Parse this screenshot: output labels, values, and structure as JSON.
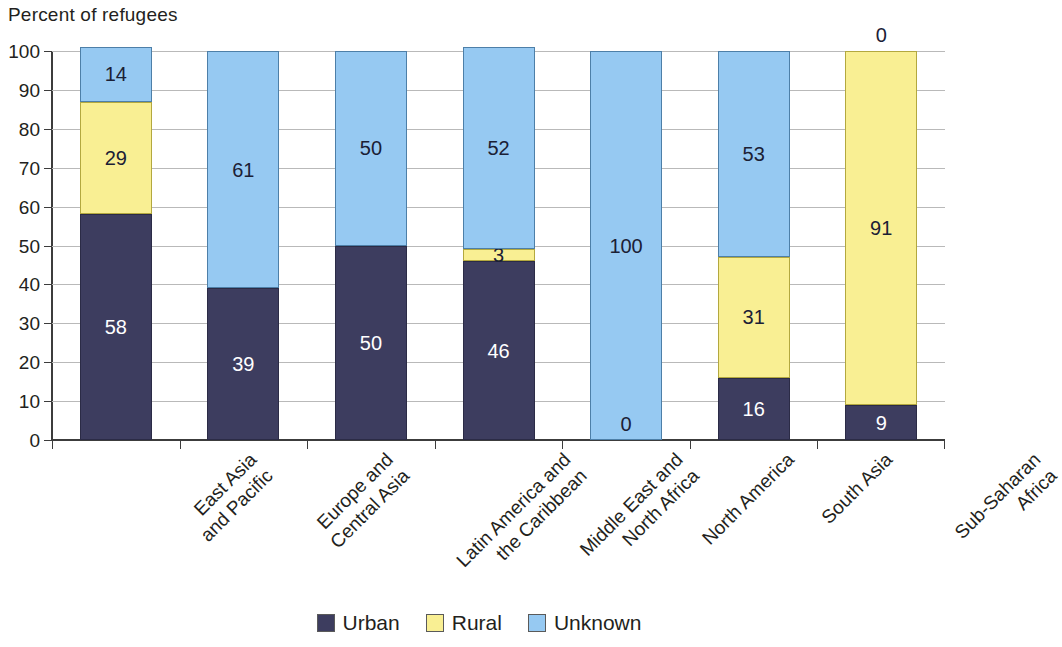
{
  "chart_data": {
    "type": "bar",
    "subtype": "stacked-bar-100",
    "title": "Percent of refugees",
    "xlabel": "",
    "ylabel": "",
    "ylim": [
      0,
      100
    ],
    "yticks": [
      0,
      10,
      20,
      30,
      40,
      50,
      60,
      70,
      80,
      90,
      100
    ],
    "ytick_labels": [
      "0",
      "10",
      "20",
      "30",
      "40",
      "50",
      "60",
      "70",
      "80",
      "90",
      "100"
    ],
    "grid": true,
    "legend_position": "bottom",
    "categories": [
      "East Asia and Pacific",
      "Europe and Central Asia",
      "Latin America and the Caribbean",
      "Middle East and North Africa",
      "North America",
      "South Asia",
      "Sub-Saharan Africa"
    ],
    "category_lines": [
      [
        "East Asia",
        "and Pacific"
      ],
      [
        "Europe and",
        "Central Asia"
      ],
      [
        "Latin America and",
        "the Caribbean"
      ],
      [
        "Middle East and",
        "North Africa"
      ],
      [
        "North America"
      ],
      [
        "South Asia"
      ],
      [
        "Sub-Saharan",
        "Africa"
      ]
    ],
    "series": [
      {
        "name": "Urban",
        "color": "#3d3d5f",
        "values": [
          58,
          39,
          50,
          46,
          0,
          16,
          9
        ],
        "labels": [
          "58",
          "39",
          "50",
          "46",
          "",
          "16",
          "9"
        ]
      },
      {
        "name": "Rural",
        "color": "#f9ef93",
        "values": [
          29,
          0,
          0,
          3,
          0,
          31,
          91
        ],
        "labels": [
          "29",
          "0",
          "0",
          "3",
          "",
          "31",
          "91"
        ]
      },
      {
        "name": "Unknown",
        "color": "#96c9f2",
        "values": [
          14,
          61,
          50,
          52,
          100,
          53,
          0
        ],
        "labels": [
          "14",
          "61",
          "50",
          "52",
          "100",
          "53",
          "0"
        ]
      }
    ],
    "annotations": [
      {
        "category": "North America",
        "text": "0",
        "position": "bottom-inside-unknown"
      },
      {
        "category": "Sub-Saharan Africa",
        "text": "0",
        "position": "above-bar-top"
      }
    ]
  },
  "legend": {
    "items": [
      {
        "label": "Urban",
        "color": "#3d3d5f",
        "swatch": "legend-swatch-urban"
      },
      {
        "label": "Rural",
        "color": "#f9ef93",
        "swatch": "legend-swatch-rural"
      },
      {
        "label": "Unknown",
        "color": "#96c9f2",
        "swatch": "legend-swatch-unknown"
      }
    ]
  }
}
